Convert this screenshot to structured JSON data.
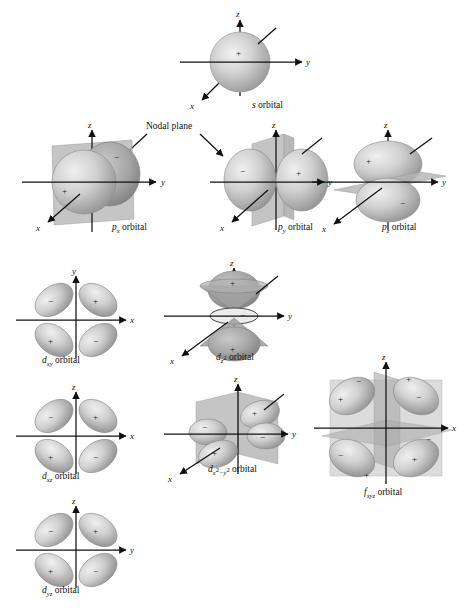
{
  "figure": {
    "background_color": "#ffffff",
    "ink_color": "#111111",
    "lobe_fill_light": "#d8d8d8",
    "lobe_fill_mid": "#bdbdbd",
    "lobe_fill_dark": "#9a9a9a",
    "plane_fill": "#b9b9b9"
  },
  "annotations": {
    "nodal_plane_label": "Nodal plane"
  },
  "axis_labels": {
    "x": "x",
    "y": "y",
    "z": "z"
  },
  "signs": {
    "positive": "+",
    "negative": "−"
  },
  "orbitals": [
    {
      "id": "s",
      "label_html": "<i>s</i> orbital",
      "label_text": "s orbital",
      "type": "s",
      "axes": [
        "z",
        "y",
        "x"
      ],
      "axes_style": "3d-perspective",
      "lobes": [
        {
          "sign": "+",
          "position": "sphere-center"
        }
      ],
      "nodal_planes": 0
    },
    {
      "id": "px",
      "label_html": "<i>p</i><sub>x</sub> orbital",
      "label_text": "px orbital",
      "type": "p",
      "axes": [
        "z",
        "y",
        "x"
      ],
      "axes_style": "3d-perspective",
      "lobes": [
        {
          "sign": "+",
          "position": "front"
        },
        {
          "sign": "−",
          "position": "back"
        }
      ],
      "nodal_planes": 1,
      "nodal_plane_callout": true
    },
    {
      "id": "py",
      "label_html": "<i>p</i><sub>y</sub> orbital",
      "label_text": "py orbital",
      "type": "p",
      "axes": [
        "z",
        "y",
        "x"
      ],
      "axes_style": "3d-perspective",
      "lobes": [
        {
          "sign": "−",
          "position": "left"
        },
        {
          "sign": "+",
          "position": "right"
        }
      ],
      "nodal_planes": 1,
      "nodal_plane_callout": true
    },
    {
      "id": "pz",
      "label_html": "<i>p</i><sub>z</sub> orbital",
      "label_text": "pz orbital",
      "type": "p",
      "axes": [
        "z",
        "y",
        "x"
      ],
      "axes_style": "3d-perspective",
      "lobes": [
        {
          "sign": "+",
          "position": "top"
        },
        {
          "sign": "−",
          "position": "bottom"
        }
      ],
      "nodal_planes": 1
    },
    {
      "id": "dxy",
      "label_html": "<i>d</i><sub>xy</sub> orbital",
      "label_text": "dxy orbital",
      "type": "d",
      "axes": [
        "y",
        "x"
      ],
      "axes_style": "planar",
      "lobes": [
        {
          "sign": "−",
          "position": "top-left"
        },
        {
          "sign": "+",
          "position": "top-right"
        },
        {
          "sign": "+",
          "position": "bottom-left"
        },
        {
          "sign": "−",
          "position": "bottom-right"
        }
      ],
      "nodal_planes": 2
    },
    {
      "id": "dz2",
      "label_html": "<i>d</i><sub>z<sup>2</sup></sub> orbital",
      "label_text": "dz2 orbital",
      "type": "d",
      "axes": [
        "z",
        "y",
        "x"
      ],
      "axes_style": "3d-perspective",
      "lobes": [
        {
          "sign": "+",
          "position": "top"
        },
        {
          "sign": "+",
          "position": "bottom"
        },
        {
          "sign": "−",
          "position": "torus"
        }
      ],
      "nodal_planes": 2,
      "nodal_shape": "cone"
    },
    {
      "id": "dxz",
      "label_html": "<i>d</i><sub>xz</sub> orbital",
      "label_text": "dxz orbital",
      "type": "d",
      "axes": [
        "z",
        "x"
      ],
      "axes_style": "planar",
      "lobes": [
        {
          "sign": "−",
          "position": "top-left"
        },
        {
          "sign": "+",
          "position": "top-right"
        },
        {
          "sign": "+",
          "position": "bottom-left"
        },
        {
          "sign": "−",
          "position": "bottom-right"
        }
      ],
      "nodal_planes": 2
    },
    {
      "id": "dx2y2",
      "label_html": "<i>d</i><sub>x<sup>2</sup>−y<sup>2</sup></sub> orbital",
      "label_text": "dx2-y2 orbital",
      "type": "d",
      "axes": [
        "z",
        "y",
        "x"
      ],
      "axes_style": "3d-perspective",
      "lobes": [
        {
          "sign": "+",
          "position": "back-right"
        },
        {
          "sign": "−",
          "position": "left"
        },
        {
          "sign": "−",
          "position": "right"
        },
        {
          "sign": "+",
          "position": "front-left"
        }
      ],
      "nodal_planes": 2
    },
    {
      "id": "dyz",
      "label_html": "<i>d</i><sub>yz</sub> orbital",
      "label_text": "dyz orbital",
      "type": "d",
      "axes": [
        "z",
        "y"
      ],
      "axes_style": "planar",
      "lobes": [
        {
          "sign": "−",
          "position": "top-left"
        },
        {
          "sign": "+",
          "position": "top-right"
        },
        {
          "sign": "+",
          "position": "bottom-left"
        },
        {
          "sign": "−",
          "position": "bottom-right"
        }
      ],
      "nodal_planes": 2
    },
    {
      "id": "fxyz",
      "label_html": "<i>f</i><sub>xyz</sub> orbital",
      "label_text": "fxyz orbital",
      "type": "f",
      "axes": [
        "z",
        "x"
      ],
      "axes_style": "3d-perspective",
      "lobes": [
        {
          "sign": "−",
          "position": "top-left-back"
        },
        {
          "sign": "+",
          "position": "top-left-front"
        },
        {
          "sign": "+",
          "position": "top-right-back"
        },
        {
          "sign": "−",
          "position": "top-right-front"
        },
        {
          "sign": "−",
          "position": "bottom-left-back"
        },
        {
          "sign": "+",
          "position": "bottom-left-front"
        },
        {
          "sign": "+",
          "position": "bottom-right-front"
        },
        {
          "sign": "−",
          "position": "bottom-right-back"
        }
      ],
      "nodal_planes": 3
    }
  ]
}
